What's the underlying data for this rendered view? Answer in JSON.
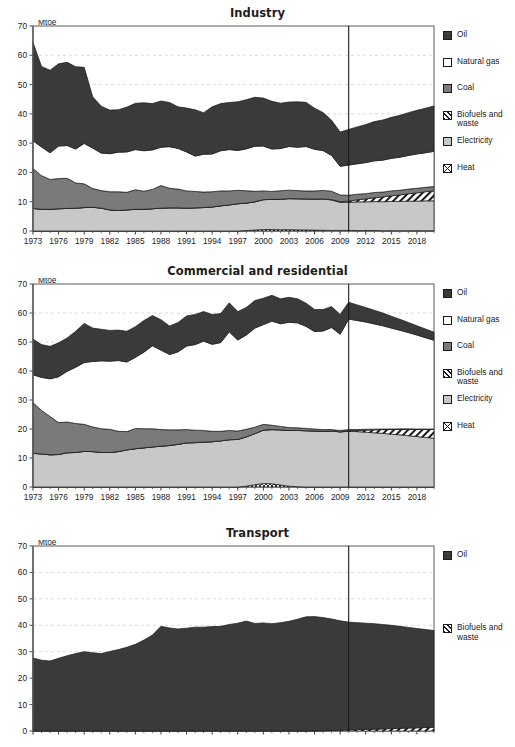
{
  "page": {
    "cropped_header_text": " ",
    "unit_label": "Mtoe"
  },
  "series_styles": {
    "Oil": {
      "fill": "#3a3a3a",
      "pattern": "solid"
    },
    "Natural gas": {
      "fill": "#ffffff",
      "pattern": "solid"
    },
    "Coal": {
      "fill": "#7a7a7a",
      "pattern": "solid"
    },
    "Biofuels and waste": {
      "fill": "#ffffff",
      "pattern": "hatch"
    },
    "Electricity": {
      "fill": "#c8c8c8",
      "pattern": "solid"
    },
    "Heat": {
      "fill": "#ffffff",
      "pattern": "crosshatch"
    }
  },
  "axis": {
    "y_ticks": [
      0,
      10,
      20,
      30,
      40,
      50,
      60,
      70
    ],
    "ylim": [
      0,
      70
    ],
    "x_ticks": [
      1973,
      1976,
      1979,
      1982,
      1985,
      1988,
      1991,
      1994,
      1997,
      2000,
      2003,
      2006,
      2009,
      2012,
      2015,
      2018
    ],
    "xlim": [
      1973,
      2020
    ],
    "projection_start": 2010,
    "grid": true
  },
  "chart_data": [
    {
      "type": "area",
      "title": "Industry",
      "xlabel": "",
      "ylabel": "Mtoe",
      "ylim": [
        0,
        70
      ],
      "xlim": [
        1973,
        2020
      ],
      "grid": true,
      "legend_position": "right",
      "stack_order": [
        "Heat",
        "Electricity",
        "Biofuels and waste",
        "Coal",
        "Natural gas",
        "Oil"
      ],
      "legend": [
        "Oil",
        "Natural gas",
        "Coal",
        "Biofuels and waste",
        "Electricity",
        "Heat"
      ],
      "x": [
        1973,
        1974,
        1975,
        1976,
        1977,
        1978,
        1979,
        1980,
        1981,
        1982,
        1983,
        1984,
        1985,
        1986,
        1987,
        1988,
        1989,
        1990,
        1991,
        1992,
        1993,
        1994,
        1995,
        1996,
        1997,
        1998,
        1999,
        2000,
        2001,
        2002,
        2003,
        2004,
        2005,
        2006,
        2007,
        2008,
        2009,
        2010,
        2011,
        2012,
        2013,
        2014,
        2015,
        2016,
        2017,
        2018,
        2019,
        2020
      ],
      "series": [
        {
          "name": "Heat",
          "values": [
            0,
            0,
            0,
            0,
            0,
            0,
            0,
            0,
            0,
            0,
            0,
            0,
            0,
            0,
            0,
            0,
            0,
            0,
            0,
            0,
            0,
            0,
            0,
            0,
            0,
            0.15,
            0.35,
            0.5,
            0.5,
            0.45,
            0.45,
            0.4,
            0.35,
            0.3,
            0.25,
            0.2,
            0.2,
            0.2,
            0.15,
            0.15,
            0.15,
            0.1,
            0.1,
            0.1,
            0.1,
            0.1,
            0.1,
            0.1
          ]
        },
        {
          "name": "Electricity",
          "values": [
            7.7,
            7.4,
            7.4,
            7.6,
            7.7,
            7.8,
            8.0,
            8.1,
            7.8,
            7.2,
            7.0,
            7.2,
            7.4,
            7.4,
            7.6,
            7.8,
            7.9,
            7.9,
            7.8,
            7.9,
            8.0,
            8.2,
            8.6,
            8.9,
            9.3,
            9.4,
            9.6,
            10.2,
            10.3,
            10.4,
            10.6,
            10.6,
            10.6,
            10.6,
            10.7,
            10.4,
            9.6,
            9.6,
            9.8,
            9.8,
            9.9,
            9.9,
            10.0,
            10.0,
            10.1,
            10.1,
            10.2,
            10.2
          ]
        },
        {
          "name": "Biofuels and waste",
          "values": [
            0,
            0,
            0,
            0,
            0,
            0,
            0,
            0,
            0,
            0,
            0,
            0,
            0,
            0,
            0,
            0,
            0,
            0,
            0,
            0,
            0,
            0,
            0,
            0,
            0,
            0,
            0,
            0,
            0,
            0,
            0,
            0,
            0,
            0,
            0,
            0.1,
            0.2,
            0.4,
            0.7,
            1.0,
            1.3,
            1.6,
            1.9,
            2.2,
            2.5,
            2.8,
            3.1,
            3.4
          ]
        },
        {
          "name": "Coal",
          "values": [
            13.6,
            11.5,
            10.2,
            10.3,
            10.3,
            8.6,
            8.1,
            6.4,
            6.0,
            6.2,
            6.4,
            6.0,
            6.7,
            6.2,
            6.6,
            7.7,
            6.7,
            6.4,
            5.9,
            5.6,
            5.3,
            5.2,
            5.1,
            4.8,
            4.6,
            4.2,
            3.6,
            3.0,
            2.7,
            2.9,
            2.9,
            2.8,
            2.7,
            2.8,
            2.9,
            2.9,
            2.3,
            2.0,
            1.9,
            1.8,
            1.8,
            1.7,
            1.7,
            1.6,
            1.6,
            1.6,
            1.5,
            1.5
          ]
        },
        {
          "name": "Natural gas",
          "values": [
            9.5,
            9.8,
            9.1,
            11.1,
            11.2,
            11.6,
            13.8,
            13.8,
            12.8,
            13.0,
            13.5,
            13.8,
            13.7,
            13.8,
            13.5,
            13.1,
            14.2,
            13.9,
            13.3,
            12.1,
            12.9,
            12.9,
            13.7,
            14.1,
            13.6,
            14.3,
            15.4,
            15.3,
            14.5,
            14.4,
            14.9,
            14.8,
            15.2,
            14.2,
            13.6,
            12.2,
            9.8,
            10.3,
            10.4,
            10.6,
            10.8,
            10.9,
            11.1,
            11.3,
            11.5,
            11.7,
            11.8,
            12.0
          ]
        },
        {
          "name": "Oil",
          "values": [
            33.6,
            27.5,
            28.2,
            28.1,
            28.4,
            28.1,
            26.0,
            17.5,
            16.0,
            14.9,
            14.5,
            15.3,
            15.8,
            16.4,
            15.8,
            15.8,
            15.1,
            14.2,
            15.0,
            15.8,
            14.2,
            16.1,
            16.1,
            16.1,
            16.6,
            16.8,
            16.7,
            16.4,
            16.3,
            15.5,
            15.2,
            15.5,
            15.1,
            14.0,
            13.0,
            12.0,
            11.7,
            12.2,
            12.6,
            13.0,
            13.4,
            13.7,
            14.0,
            14.3,
            14.6,
            14.9,
            15.2,
            15.5
          ]
        }
      ]
    },
    {
      "type": "area",
      "title": "Commercial and residential",
      "xlabel": "",
      "ylabel": "Mtoe",
      "ylim": [
        0,
        70
      ],
      "xlim": [
        1973,
        2020
      ],
      "grid": true,
      "legend_position": "right",
      "stack_order": [
        "Heat",
        "Electricity",
        "Biofuels and waste",
        "Coal",
        "Natural gas",
        "Oil"
      ],
      "legend": [
        "Oil",
        "Natural gas",
        "Coal",
        "Biofuels and waste",
        "Electricity",
        "Heat"
      ],
      "x": [
        1973,
        1974,
        1975,
        1976,
        1977,
        1978,
        1979,
        1980,
        1981,
        1982,
        1983,
        1984,
        1985,
        1986,
        1987,
        1988,
        1989,
        1990,
        1991,
        1992,
        1993,
        1994,
        1995,
        1996,
        1997,
        1998,
        1999,
        2000,
        2001,
        2002,
        2003,
        2004,
        2005,
        2006,
        2007,
        2008,
        2009,
        2010,
        2011,
        2012,
        2013,
        2014,
        2015,
        2016,
        2017,
        2018,
        2019,
        2020
      ],
      "series": [
        {
          "name": "Heat",
          "values": [
            0,
            0,
            0,
            0,
            0,
            0,
            0,
            0,
            0,
            0,
            0,
            0,
            0,
            0,
            0,
            0,
            0,
            0,
            0,
            0,
            0,
            0,
            0,
            0,
            0,
            0.3,
            0.8,
            1.2,
            1.1,
            0.7,
            0.3,
            0.1,
            0,
            0,
            0,
            0,
            0,
            0,
            0,
            0,
            0,
            0,
            0,
            0,
            0,
            0,
            0,
            0
          ]
        },
        {
          "name": "Electricity",
          "values": [
            11.6,
            11.4,
            11.1,
            11.2,
            11.8,
            11.9,
            12.3,
            12.2,
            11.9,
            11.9,
            12.2,
            12.8,
            13.2,
            13.5,
            13.8,
            14.1,
            14.3,
            14.7,
            15.2,
            15.3,
            15.5,
            15.6,
            15.9,
            16.3,
            16.4,
            17.0,
            17.6,
            18.4,
            18.7,
            19.0,
            19.2,
            19.4,
            19.4,
            19.3,
            19.2,
            19.3,
            19.0,
            19.2,
            19.1,
            18.9,
            18.7,
            18.5,
            18.2,
            18.0,
            17.7,
            17.4,
            17.1,
            16.8
          ]
        },
        {
          "name": "Biofuels and waste",
          "values": [
            0,
            0,
            0,
            0,
            0,
            0,
            0,
            0,
            0,
            0,
            0,
            0,
            0,
            0,
            0,
            0,
            0,
            0,
            0,
            0,
            0,
            0,
            0,
            0,
            0,
            0,
            0,
            0,
            0,
            0,
            0,
            0,
            0,
            0,
            0,
            0,
            0,
            0.2,
            0.4,
            0.7,
            1.0,
            1.3,
            1.6,
            1.9,
            2.2,
            2.5,
            2.8,
            3.1
          ]
        },
        {
          "name": "Coal",
          "values": [
            17.5,
            15.0,
            13.2,
            11.0,
            10.6,
            10.0,
            9.3,
            8.5,
            8.2,
            8.0,
            7.0,
            6.3,
            7.0,
            6.6,
            6.3,
            5.7,
            5.4,
            5.0,
            4.6,
            4.3,
            4.0,
            3.6,
            3.3,
            3.2,
            2.9,
            2.6,
            2.2,
            2.0,
            1.5,
            1.2,
            1.0,
            0.9,
            0.8,
            0.7,
            0.6,
            0.5,
            0.5,
            0.4,
            0.3,
            0.3,
            0.25,
            0.2,
            0.2,
            0.15,
            0.15,
            0.1,
            0.1,
            0.1
          ]
        },
        {
          "name": "Natural gas",
          "values": [
            9.6,
            11.4,
            13.0,
            15.8,
            17.5,
            19.4,
            21.3,
            22.6,
            23.4,
            23.5,
            24.4,
            24.0,
            24.5,
            26.4,
            28.6,
            27.4,
            26.0,
            26.9,
            28.8,
            29.5,
            30.8,
            30.0,
            30.6,
            34.0,
            31.4,
            32.5,
            34.2,
            34.4,
            35.9,
            35.4,
            36.3,
            36.2,
            35.2,
            33.6,
            34.0,
            35.2,
            33.2,
            38.1,
            37.6,
            37.0,
            36.3,
            35.6,
            34.8,
            34.0,
            33.2,
            32.4,
            31.5,
            30.6
          ]
        },
        {
          "name": "Oil",
          "values": [
            12.3,
            11.3,
            11.2,
            11.7,
            11.5,
            12.4,
            13.5,
            11.5,
            10.9,
            10.6,
            10.5,
            10.6,
            10.6,
            10.9,
            10.4,
            10.5,
            9.8,
            10.1,
            10.4,
            10.4,
            10.2,
            10.3,
            10.0,
            10.0,
            9.8,
            9.5,
            9.5,
            9.1,
            8.9,
            8.6,
            8.6,
            8.3,
            8.0,
            7.6,
            7.4,
            7.2,
            6.8,
            5.8,
            5.4,
            5.0,
            4.7,
            4.4,
            4.1,
            3.8,
            3.5,
            3.2,
            3.0,
            2.8
          ]
        }
      ]
    },
    {
      "type": "area",
      "title": "Transport",
      "xlabel": "",
      "ylabel": "Mtoe",
      "ylim": [
        0,
        70
      ],
      "xlim": [
        1973,
        2020
      ],
      "grid": true,
      "legend_position": "right",
      "stack_order": [
        "Biofuels and waste",
        "Oil"
      ],
      "legend": [
        "Oil",
        "Biofuels and waste"
      ],
      "x": [
        1973,
        1974,
        1975,
        1976,
        1977,
        1978,
        1979,
        1980,
        1981,
        1982,
        1983,
        1984,
        1985,
        1986,
        1987,
        1988,
        1989,
        1990,
        1991,
        1992,
        1993,
        1994,
        1995,
        1996,
        1997,
        1998,
        1999,
        2000,
        2001,
        2002,
        2003,
        2004,
        2005,
        2006,
        2007,
        2008,
        2009,
        2010,
        2011,
        2012,
        2013,
        2014,
        2015,
        2016,
        2017,
        2018,
        2019,
        2020
      ],
      "series": [
        {
          "name": "Biofuels and waste",
          "values": [
            0,
            0,
            0,
            0,
            0,
            0,
            0,
            0,
            0,
            0,
            0,
            0,
            0,
            0,
            0,
            0,
            0,
            0,
            0,
            0,
            0,
            0,
            0,
            0,
            0,
            0,
            0,
            0,
            0,
            0,
            0,
            0,
            0,
            0,
            0.1,
            0.2,
            0.3,
            0.4,
            0.5,
            0.6,
            0.7,
            0.8,
            0.9,
            1.0,
            1.1,
            1.2,
            1.3,
            1.4
          ]
        },
        {
          "name": "Oil",
          "values": [
            27.6,
            26.8,
            26.5,
            27.5,
            28.5,
            29.3,
            30.0,
            29.6,
            29.3,
            30.1,
            30.8,
            31.7,
            32.8,
            34.4,
            36.3,
            39.6,
            39.0,
            38.6,
            38.9,
            39.3,
            39.3,
            39.5,
            39.6,
            40.3,
            40.8,
            41.6,
            40.7,
            40.9,
            40.6,
            41.0,
            41.5,
            42.3,
            43.2,
            43.3,
            42.8,
            42.2,
            41.4,
            40.8,
            40.5,
            40.2,
            39.9,
            39.5,
            39.1,
            38.6,
            38.1,
            37.6,
            37.1,
            36.6
          ]
        }
      ]
    }
  ]
}
